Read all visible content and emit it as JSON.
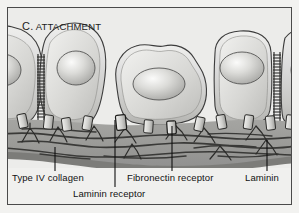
{
  "figure": {
    "panel_letter": "C.",
    "panel_title": "ATTACHMENT",
    "background_color": "#ececeb",
    "border_color": "#4a4a4a"
  },
  "labels": {
    "collagen": "Type IV collagen",
    "laminin_receptor": "Laminin receptor",
    "fibronectin_receptor": "Fibronectin receptor",
    "laminin": "Laminin"
  },
  "diagram": {
    "kind": "cell-attachment-schematic",
    "colors": {
      "cell_fill_light": "#e8e8e6",
      "cell_fill_mid": "#c9c9c6",
      "cell_outline": "#3c3c3c",
      "nucleus_light": "#f4f4f2",
      "nucleus_mid": "#b8b8b5",
      "membrane_band": "#9a9a97",
      "lamina_densa": "#7c7c79",
      "fiber_color": "#3a3a38",
      "receptor_fill": "#d8d8d5",
      "receptor_outline": "#2e2e2c",
      "leader_line": "#101010"
    },
    "cells": [
      {
        "name": "cell-left-partial",
        "cx": 8,
        "cy": 72,
        "rx": 26,
        "ry": 44
      },
      {
        "name": "cell-two",
        "cx": 62,
        "cy": 70,
        "rx": 32,
        "ry": 45
      },
      {
        "name": "cell-middle",
        "cx": 152,
        "cy": 78,
        "rx": 48,
        "ry": 38
      },
      {
        "name": "cell-right",
        "cx": 236,
        "cy": 72,
        "rx": 35,
        "ry": 45
      },
      {
        "name": "cell-far-right-partial",
        "cx": 292,
        "cy": 70,
        "rx": 24,
        "ry": 44
      }
    ],
    "junctions": [
      {
        "name": "desmosome-left",
        "x": 33,
        "y_top": 48,
        "y_bottom": 112,
        "rungs": 22
      },
      {
        "name": "desmosome-right",
        "x": 272,
        "y_top": 45,
        "y_bottom": 112,
        "rungs": 23
      }
    ],
    "receptors_x": [
      18,
      40,
      58,
      79,
      112,
      140,
      163,
      191,
      213,
      240,
      262,
      284
    ],
    "membrane": {
      "top": 118,
      "bottom": 158
    },
    "leader_lines": [
      {
        "name": "collagen",
        "x": 53,
        "y_top": 146,
        "y_bottom": 170
      },
      {
        "name": "laminin-receptor",
        "x": 113,
        "y_top": 116,
        "y_bottom": 186
      },
      {
        "name": "fibronectin-receptor",
        "x": 170,
        "y_top": 122,
        "y_bottom": 170
      },
      {
        "name": "laminin",
        "x": 265,
        "y_top": 138,
        "y_bottom": 170
      }
    ]
  }
}
